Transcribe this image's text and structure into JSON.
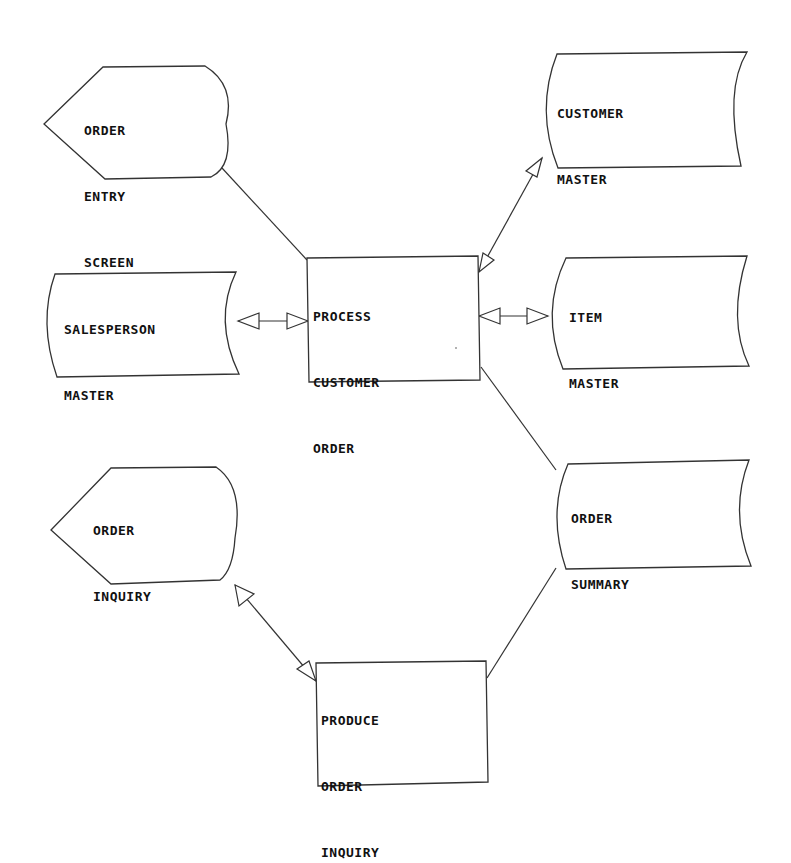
{
  "diagram": {
    "type": "data-flow-diagram",
    "nodes": [
      {
        "id": "order-entry-screen",
        "kind": "display",
        "lines": [
          "ORDER",
          "ENTRY",
          "SCREEN"
        ]
      },
      {
        "id": "customer-master",
        "kind": "stored-data",
        "lines": [
          "CUSTOMER",
          "MASTER"
        ]
      },
      {
        "id": "salesperson-master",
        "kind": "stored-data",
        "lines": [
          "SALESPERSON",
          "MASTER"
        ]
      },
      {
        "id": "process-customer-order",
        "kind": "process",
        "lines": [
          "PROCESS",
          "CUSTOMER",
          "ORDER"
        ]
      },
      {
        "id": "item-master",
        "kind": "stored-data",
        "lines": [
          "ITEM",
          "MASTER"
        ]
      },
      {
        "id": "order-inquiry",
        "kind": "display",
        "lines": [
          "ORDER",
          "INQUIRY"
        ]
      },
      {
        "id": "order-summary",
        "kind": "stored-data",
        "lines": [
          "ORDER",
          "SUMMARY"
        ]
      },
      {
        "id": "produce-order-inquiry",
        "kind": "process",
        "lines": [
          "PRODUCE",
          "ORDER",
          "INQUIRY"
        ]
      }
    ],
    "edges": [
      {
        "from": "order-entry-screen",
        "to": "process-customer-order",
        "arrows": "none"
      },
      {
        "from": "process-customer-order",
        "to": "customer-master",
        "arrows": "both"
      },
      {
        "from": "salesperson-master",
        "to": "process-customer-order",
        "arrows": "both"
      },
      {
        "from": "process-customer-order",
        "to": "item-master",
        "arrows": "both"
      },
      {
        "from": "process-customer-order",
        "to": "order-summary",
        "arrows": "none"
      },
      {
        "from": "order-summary",
        "to": "produce-order-inquiry",
        "arrows": "none"
      },
      {
        "from": "order-inquiry",
        "to": "produce-order-inquiry",
        "arrows": "both"
      }
    ]
  },
  "labels": {
    "order_entry_screen": {
      "l1": "ORDER",
      "l2": "ENTRY",
      "l3": "SCREEN"
    },
    "customer_master": {
      "l1": "CUSTOMER",
      "l2": "MASTER"
    },
    "salesperson_master": {
      "l1": "SALESPERSON",
      "l2": "MASTER"
    },
    "process_customer_order": {
      "l1": "PROCESS",
      "l2": "CUSTOMER",
      "l3": "ORDER"
    },
    "item_master": {
      "l1": "ITEM",
      "l2": "MASTER"
    },
    "order_inquiry": {
      "l1": "ORDER",
      "l2": "INQUIRY"
    },
    "order_summary": {
      "l1": "ORDER",
      "l2": "SUMMARY"
    },
    "produce_order_inquiry": {
      "l1": "PRODUCE",
      "l2": "ORDER",
      "l3": "INQUIRY"
    }
  }
}
